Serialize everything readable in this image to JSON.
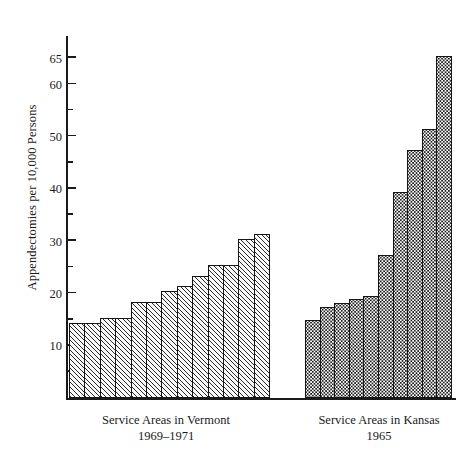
{
  "chart_data": {
    "type": "bar",
    "title": "",
    "xlabel": "",
    "ylabel": "Appendectomies per 10,000 Persons",
    "ylim": [
      0,
      65
    ],
    "grid": false,
    "legend_position": "none",
    "y_ticks_major": [
      10,
      20,
      30,
      40,
      50,
      60,
      65
    ],
    "y_ticks_minor": [
      5,
      15,
      25,
      35,
      45,
      55
    ],
    "y_tick_labels": [
      "10",
      "20",
      "30",
      "40",
      "50",
      "60",
      "65"
    ],
    "groups": [
      {
        "name": "vermont",
        "caption_line1": "Service Areas in Vermont",
        "caption_line2": "1969–1971",
        "fill": "diagonal-hatch",
        "categories": [
          "1",
          "2",
          "3",
          "4",
          "5",
          "6",
          "7",
          "8",
          "9",
          "10",
          "11",
          "12"
        ],
        "values": [
          14,
          14,
          15,
          15,
          18,
          18,
          20,
          21,
          23,
          25,
          25,
          30,
          31
        ]
      },
      {
        "name": "kansas",
        "caption_line1": "Service Areas in Kansas",
        "caption_line2": "1965",
        "fill": "stipple-dots",
        "categories": [
          "1",
          "2",
          "3",
          "4",
          "5",
          "6",
          "7",
          "8",
          "9",
          "10"
        ],
        "values": [
          14.5,
          17,
          17.8,
          18.5,
          19.2,
          27,
          39,
          47,
          51,
          65
        ]
      }
    ],
    "series": [
      {
        "name": "Service Areas in Vermont 1969–1971",
        "values": [
          14,
          14,
          15,
          15,
          18,
          18,
          20,
          21,
          23,
          25,
          25,
          30,
          31
        ]
      },
      {
        "name": "Service Areas in Kansas 1965",
        "values": [
          14.5,
          17,
          17.8,
          18.5,
          19.2,
          27,
          39,
          47,
          51,
          65
        ]
      }
    ],
    "colors": {
      "ink": "#1a1a1a",
      "bar_outline": "#151515",
      "background": "#ffffff"
    }
  }
}
